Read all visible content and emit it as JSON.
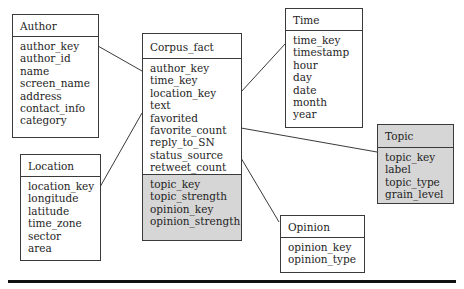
{
  "diagram": {
    "type": "star-schema",
    "entities": {
      "author": {
        "title": "Author",
        "attributes": [
          "author_key",
          "author_id",
          "name",
          "screen_name",
          "address",
          "contact_info",
          "category"
        ]
      },
      "location": {
        "title": "Location",
        "attributes": [
          "location_key",
          "longitude",
          "latitude",
          "time_zone",
          "sector",
          "area"
        ]
      },
      "corpus_fact": {
        "title": "Corpus_fact",
        "attributes": [
          "author_key",
          "time_key",
          "location_key",
          "text",
          "favorited",
          "favorite_count",
          "reply_to_SN",
          "status_source",
          "retweet_count"
        ],
        "shaded_attributes": [
          "topic_key",
          "topic_strength",
          "opinion_key",
          "opinion_strength"
        ]
      },
      "time": {
        "title": "Time",
        "attributes": [
          "time_key",
          "timestamp",
          "hour",
          "day",
          "date",
          "month",
          "year"
        ]
      },
      "topic": {
        "title": "Topic",
        "attributes": [
          "topic_key",
          "label",
          "topic_type",
          "grain_level"
        ]
      },
      "opinion": {
        "title": "Opinion",
        "attributes": [
          "opinion_key",
          "opinion_type"
        ]
      }
    },
    "relationships": [
      {
        "from": "Author",
        "to": "Corpus_fact"
      },
      {
        "from": "Location",
        "to": "Corpus_fact"
      },
      {
        "from": "Time",
        "to": "Corpus_fact"
      },
      {
        "from": "Topic",
        "to": "Corpus_fact"
      },
      {
        "from": "Opinion",
        "to": "Corpus_fact"
      }
    ],
    "colors": {
      "border": "#3a3a3a",
      "shaded_fill": "#d6d6d6",
      "background": "#ffffff",
      "rule": "#111111"
    }
  }
}
